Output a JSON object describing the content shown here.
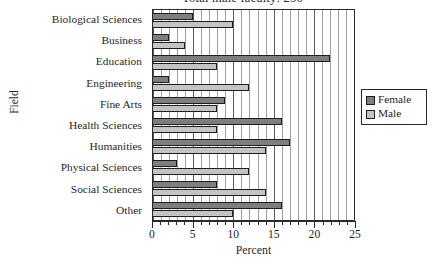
{
  "chart_data": {
    "type": "bar",
    "orientation": "horizontal",
    "title": "Total male faculty: 250",
    "xlabel": "Percent",
    "ylabel": "Field",
    "xlim": [
      0,
      25
    ],
    "xticks": [
      0,
      5,
      10,
      15,
      20,
      25
    ],
    "xtick_labels": [
      "0",
      "5",
      "10",
      "15",
      "20",
      "25"
    ],
    "minor_tick_step": 1,
    "grid": "vertical",
    "legend_position": "right",
    "categories": [
      "Biological Sciences",
      "Business",
      "Education",
      "Engineering",
      "Fine Arts",
      "Health Sciences",
      "Humanities",
      "Physical Sciences",
      "Social Sciences",
      "Other"
    ],
    "series": [
      {
        "name": "Female",
        "color": "#7e7e7e",
        "values": [
          5,
          2,
          22,
          2,
          9,
          16,
          17,
          3,
          8,
          16
        ]
      },
      {
        "name": "Male",
        "color": "#c4c4c4",
        "values": [
          10,
          4,
          8,
          12,
          8,
          8,
          14,
          12,
          14,
          10
        ]
      }
    ]
  },
  "legend": {
    "items": [
      {
        "label": "Female",
        "swatch": "female"
      },
      {
        "label": "Male",
        "swatch": "male"
      }
    ]
  },
  "colors": {
    "female": "#7e7e7e",
    "male": "#c4c4c4",
    "axis": "#2a2a2a",
    "gridline_minor": "#9d9d9d",
    "gridline_major": "#5a5a5a",
    "background": "#ffffff"
  }
}
